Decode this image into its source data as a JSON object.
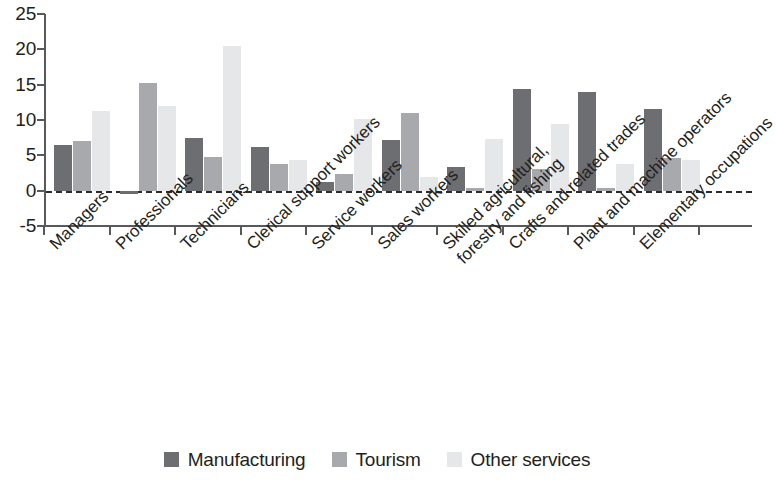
{
  "chart_data": {
    "type": "bar",
    "title": "",
    "subtitle": "",
    "xlabel": "",
    "ylabel": "",
    "ylim": [
      -5,
      25
    ],
    "yticks": [
      25,
      20,
      15,
      10,
      5,
      0,
      -5
    ],
    "ytick_labels": [
      "25",
      "20",
      "15",
      "10",
      "5",
      "0",
      "-5"
    ],
    "grid": false,
    "legend_position": "bottom",
    "zero_line": true,
    "categories": [
      "Managers",
      "Professionals",
      "Technicians",
      "Clerical support workers",
      "Service workers",
      "Sales workers",
      "Skilled agricultural, forestry and fishing",
      "Crafts and related trades",
      "Plant and machine operators",
      "Elementary occupations"
    ],
    "category_lines": [
      [
        "Managers"
      ],
      [
        "Professionals"
      ],
      [
        "Technicians"
      ],
      [
        "Clerical support workers"
      ],
      [
        "Service workers"
      ],
      [
        "Sales workers"
      ],
      [
        "Skilled agricultural,",
        "forestry and fishing"
      ],
      [
        "Crafts and related trades"
      ],
      [
        "Plant and machine operators"
      ],
      [
        "Elementary occupations"
      ]
    ],
    "series": [
      {
        "name": "Manufacturing",
        "color": "#6d6e71",
        "values": [
          6.5,
          -0.4,
          7.5,
          6.2,
          1.3,
          7.2,
          3.4,
          14.4,
          14.0,
          11.5
        ]
      },
      {
        "name": "Tourism",
        "color": "#a7a9ac",
        "values": [
          7.0,
          15.2,
          4.7,
          3.8,
          2.4,
          11.0,
          0.1,
          3.1,
          0.1,
          4.6
        ]
      },
      {
        "name": "Other services",
        "color": "#e6e7e8",
        "values": [
          11.3,
          12.0,
          20.5,
          4.3,
          10.1,
          2.0,
          7.3,
          9.5,
          3.8,
          4.3
        ]
      }
    ]
  },
  "legend": {
    "items": [
      {
        "label": "Manufacturing",
        "color": "#6d6e71"
      },
      {
        "label": "Tourism",
        "color": "#a7a9ac"
      },
      {
        "label": "Other services",
        "color": "#e6e7e8"
      }
    ]
  },
  "colors": {
    "axis": "#58595b",
    "text": "#231f20",
    "series_dark": "#6d6e71",
    "series_mid": "#a7a9ac",
    "series_light": "#e6e7e8",
    "background": "#ffffff"
  }
}
